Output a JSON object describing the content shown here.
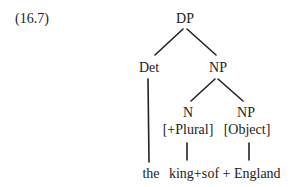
{
  "example_number": "(16.7)",
  "tree": {
    "root": "DP",
    "det": {
      "label": "Det",
      "word": "the"
    },
    "np": {
      "label": "NP",
      "n": {
        "label": "N",
        "feature": "[+Plural]",
        "word": "king+s"
      },
      "np_object": {
        "label": "NP",
        "feature": "[Object]",
        "word": "of + England"
      }
    }
  }
}
